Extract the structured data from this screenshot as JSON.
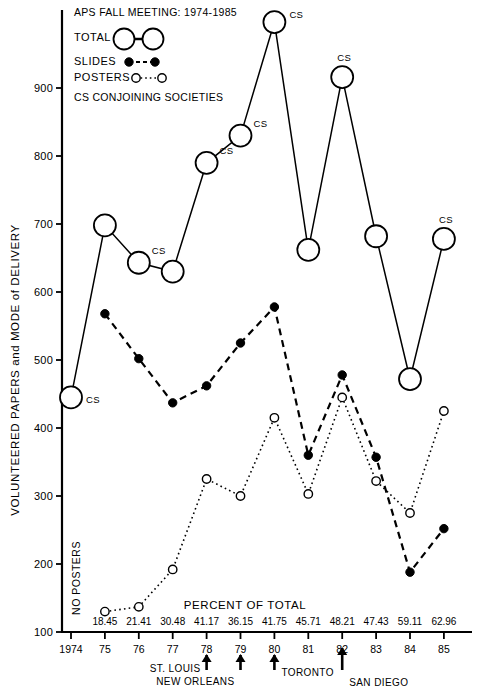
{
  "header": {
    "title": "APS FALL MEETING: 1974-1985",
    "note": "CS CONJOINING SOCIETIES"
  },
  "legend": {
    "total_label": "TOTAL",
    "slides_label": "SLIDES",
    "posters_label": "POSTERS"
  },
  "annotations": {
    "no_posters": "NO POSTERS",
    "percent_of_total": "PERCENT OF TOTAL",
    "cs_marker": "CS",
    "cities": [
      {
        "label": "ST. LOUIS",
        "year": "78"
      },
      {
        "label": "NEW ORLEANS",
        "year": "79"
      },
      {
        "label": "TORONTO",
        "year": "80"
      },
      {
        "label": "SAN DIEGO",
        "year": "82"
      }
    ]
  },
  "chart_data": {
    "type": "line",
    "title": "APS FALL MEETING: 1974-1985",
    "xlabel": "PERCENT OF TOTAL",
    "ylabel": "VOLUNTEERED PAPERS and MODE of DELIVERY",
    "categories": [
      "1974",
      "75",
      "76",
      "77",
      "78",
      "79",
      "80",
      "81",
      "82",
      "83",
      "84",
      "85"
    ],
    "xticks": [
      "1974",
      "75",
      "76",
      "77",
      "78",
      "79",
      "80",
      "81",
      "82",
      "83",
      "84",
      "85"
    ],
    "yticks": [
      100,
      200,
      300,
      400,
      500,
      600,
      700,
      800,
      900
    ],
    "ylim": [
      100,
      1010
    ],
    "grid": false,
    "legend_position": "top-left",
    "percent_labels": [
      "",
      "18.45",
      "21.41",
      "30.48",
      "41.17",
      "36.15",
      "41.75",
      "45.71",
      "48.21",
      "47.43",
      "59.11",
      "62.96"
    ],
    "cs_years": [
      "1974",
      "76",
      "78",
      "79",
      "80",
      "82",
      "85"
    ],
    "series": [
      {
        "name": "TOTAL",
        "marker": "open-large",
        "values": [
          445,
          698,
          643,
          630,
          790,
          830,
          997,
          662,
          916,
          682,
          472,
          678
        ]
      },
      {
        "name": "SLIDES",
        "marker": "filled",
        "values": [
          null,
          568,
          502,
          437,
          462,
          525,
          578,
          360,
          478,
          357,
          188,
          252
        ]
      },
      {
        "name": "POSTERS",
        "marker": "open-small",
        "values": [
          null,
          130,
          137,
          192,
          325,
          300,
          415,
          303,
          445,
          322,
          275,
          425
        ]
      }
    ]
  }
}
